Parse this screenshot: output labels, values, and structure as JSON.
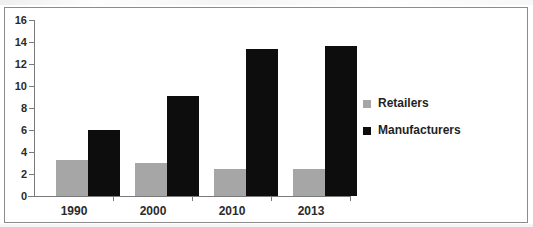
{
  "chart_data": {
    "type": "bar",
    "title": "",
    "subtitle": "",
    "xlabel": "",
    "ylabel": "",
    "categories": [
      "1990",
      "2000",
      "2010",
      "2013"
    ],
    "series": [
      {
        "name": "Retailers",
        "color": "#a6a6a6",
        "values": [
          3.3,
          3.0,
          2.5,
          2.5
        ]
      },
      {
        "name": "Manufacturers",
        "color": "#0d0d0d",
        "values": [
          6.0,
          9.05,
          13.35,
          13.65
        ]
      }
    ],
    "ylim": [
      0,
      16
    ],
    "yticks": [
      0,
      2,
      4,
      6,
      8,
      10,
      12,
      14,
      16
    ],
    "ytick_labels": [
      "0",
      "2",
      "4",
      "6",
      "8",
      "10",
      "12",
      "14",
      "16"
    ],
    "grid": false,
    "legend_position": "right",
    "legend_entries": [
      "Retailers",
      "Manufacturers"
    ],
    "annotations": []
  },
  "figure": {
    "border_color": "#8c8c8c",
    "axis_color": "#7a7a7a",
    "background": "#ffffff"
  }
}
